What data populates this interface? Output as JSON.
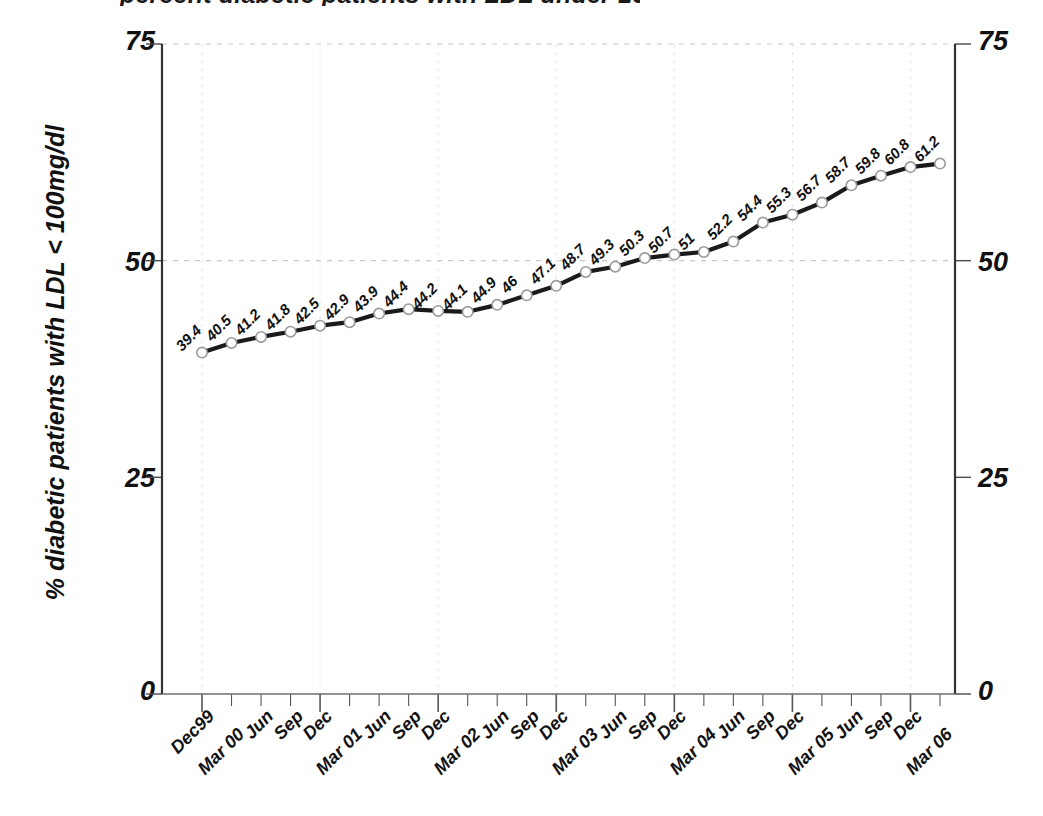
{
  "title_partial": "percent diabetic patients with LDL under 100 mg/dl",
  "chart_data": {
    "type": "line",
    "title": "",
    "xlabel": "",
    "ylabel": "% diabetic patients with LDL < 100mg/dl",
    "ylim": [
      0,
      75
    ],
    "yticks": [
      "0",
      "25",
      "50",
      "75"
    ],
    "ytick_values": [
      0,
      25,
      50,
      75
    ],
    "grid": true,
    "gridlines_y": [
      50,
      75
    ],
    "legend": "none",
    "marker": "open-circle",
    "line_color": "#1a1a1a",
    "marker_color": "#9a9a9a",
    "grid_color": "#c8c8c8",
    "axis_color": "#333333",
    "categories": [
      "Dec99",
      "Mar 00",
      "Jun",
      "Sep",
      "Dec",
      "Mar 01",
      "Jun",
      "Sep",
      "Dec",
      "Mar 02",
      "Jun",
      "Sep",
      "Dec",
      "Mar 03",
      "Jun",
      "Sep",
      "Dec",
      "Mar 04",
      "Jun",
      "Sep",
      "Dec",
      "Mar 05",
      "Jun",
      "Sep",
      "Dec",
      "Mar 06"
    ],
    "values": [
      39.4,
      40.5,
      41.2,
      41.8,
      42.5,
      42.9,
      43.9,
      44.4,
      44.2,
      44.1,
      44.9,
      46,
      47.1,
      48.7,
      49.3,
      50.3,
      50.7,
      51,
      52.2,
      54.4,
      55.3,
      56.7,
      58.7,
      59.8,
      60.8,
      61.2
    ],
    "value_labels": [
      "39.4",
      "40.5",
      "41.2",
      "41.8",
      "42.5",
      "42.9",
      "43.9",
      "44.4",
      "44.2",
      "44.1",
      "44.9",
      "46",
      "47.1",
      "48.7",
      "49.3",
      "50.3",
      "50.7",
      "51",
      "52.2",
      "54.4",
      "55.3",
      "56.7",
      "58.7",
      "59.8",
      "60.8",
      "61.2"
    ],
    "axes": {
      "left_labels": [
        "75",
        "50",
        "25",
        "0"
      ],
      "right_labels": [
        "75",
        "50",
        "25",
        "0"
      ]
    }
  }
}
